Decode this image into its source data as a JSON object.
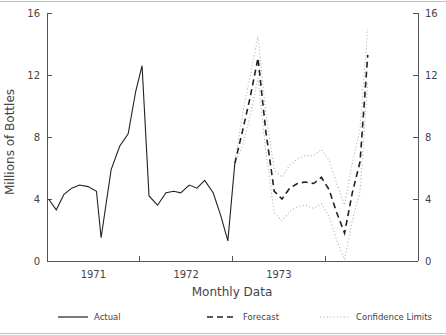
{
  "chart_data": {
    "type": "line",
    "title": "",
    "xlabel": "Monthly Data",
    "ylabel": "Millions of Bottles",
    "ylim": [
      0,
      16
    ],
    "xlim": [
      0,
      48
    ],
    "grid": false,
    "y_ticks": [
      0,
      4,
      8,
      12,
      16
    ],
    "y_tick_labels": [
      "0",
      "4",
      "8",
      "12",
      "16"
    ],
    "right_axis_ticks": [
      0,
      4,
      8,
      12,
      16
    ],
    "right_axis_tick_labels": [
      "0",
      "4",
      "8",
      "12",
      "16"
    ],
    "x_tick_labels": [
      "1971",
      "1972",
      "1973"
    ],
    "x_tick_positions": [
      6,
      18,
      30
    ],
    "x_axis_minor_ticks": [
      12,
      24,
      36
    ],
    "legend_position": "bottom",
    "legend": [
      {
        "label": "Actual",
        "style": "solid",
        "color": "#222222"
      },
      {
        "label": "Forecast",
        "style": "dashed",
        "color": "#222222"
      },
      {
        "label": "Confidence Limits",
        "style": "dotted",
        "color": "#b9b9b9"
      }
    ],
    "series": [
      {
        "name": "Actual",
        "style": "solid",
        "x": [
          0.2,
          1.2,
          2.2,
          3.2,
          4.2,
          5.3,
          6.4,
          7.0,
          8.3,
          9.4,
          10.5,
          11.5,
          12.3,
          13.2,
          14.3,
          15.4,
          16.4,
          17.3,
          18.4,
          19.4,
          20.4,
          21.5,
          22.5,
          23.4,
          24.3
        ],
        "values": [
          4.0,
          3.3,
          4.3,
          4.7,
          4.9,
          4.8,
          4.5,
          1.5,
          5.9,
          7.4,
          8.2,
          11.0,
          12.6,
          4.2,
          3.6,
          4.4,
          4.5,
          4.4,
          4.9,
          4.7,
          5.2,
          4.4,
          2.9,
          1.3,
          6.3
        ]
      },
      {
        "name": "Forecast",
        "style": "dashed",
        "x": [
          24.3,
          25.3,
          26.3,
          27.3,
          28.3,
          29.4,
          30.4,
          31.4,
          32.4,
          33.4,
          34.5,
          35.5,
          36.5,
          37.5,
          38.5,
          39.5,
          40.5,
          41.5
        ],
        "values": [
          6.3,
          8.4,
          10.6,
          13.1,
          8.4,
          4.5,
          4.0,
          4.7,
          5.0,
          5.1,
          5.0,
          5.4,
          4.6,
          3.1,
          1.8,
          4.4,
          6.4,
          13.3
        ]
      },
      {
        "name": "Upper Confidence Limit",
        "style": "dotted",
        "x": [
          24.3,
          25.3,
          26.3,
          27.3,
          28.3,
          29.4,
          30.4,
          31.4,
          32.4,
          33.4,
          34.5,
          35.5,
          36.5,
          37.5,
          38.5,
          39.5,
          40.5,
          41.5
        ],
        "values": [
          6.3,
          9.5,
          12.0,
          14.5,
          9.6,
          5.9,
          5.4,
          6.2,
          6.6,
          6.8,
          6.8,
          7.2,
          6.5,
          5.0,
          3.6,
          6.3,
          8.5,
          15.0
        ]
      },
      {
        "name": "Lower Confidence Limit",
        "style": "dotted",
        "x": [
          24.3,
          25.3,
          26.3,
          27.3,
          28.3,
          29.4,
          30.4,
          31.4,
          32.4,
          33.4,
          34.5,
          35.5,
          36.5,
          37.5,
          38.5,
          39.5,
          40.5,
          41.5
        ],
        "values": [
          6.3,
          7.4,
          9.4,
          11.8,
          7.1,
          3.1,
          2.6,
          3.2,
          3.5,
          3.6,
          3.4,
          3.7,
          2.9,
          1.3,
          0.1,
          2.6,
          4.5,
          11.6
        ]
      }
    ]
  },
  "legend": {
    "actual": "Actual",
    "forecast": "Forecast",
    "confidence": "Confidence Limits"
  },
  "axes": {
    "ylabel": "Millions of Bottles",
    "xlabel": "Monthly Data"
  }
}
